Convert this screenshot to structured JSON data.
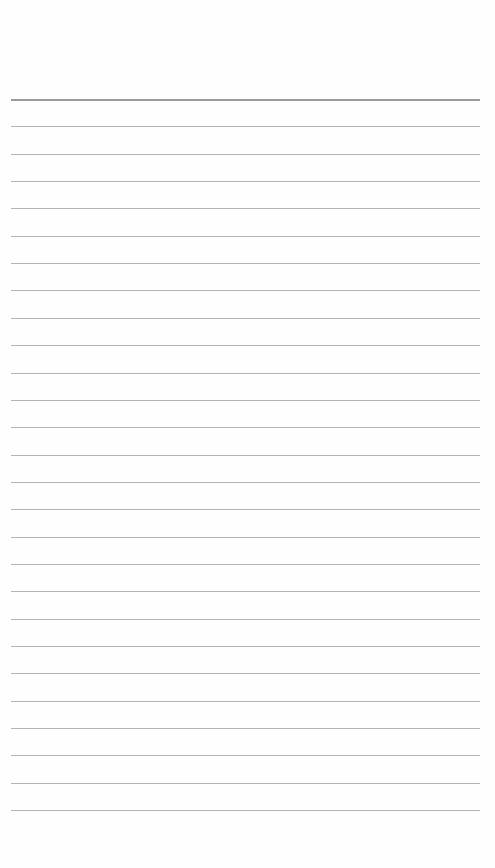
{
  "page": {
    "type": "blank-lined-paper",
    "line_count": 27,
    "first_line_y": 99,
    "line_spacing": 27.35,
    "line_left": 11,
    "line_width": 469,
    "colors": {
      "background": "#fefefe",
      "header_rule": "#9a9a9a",
      "rule": "#b4b4b4"
    }
  }
}
